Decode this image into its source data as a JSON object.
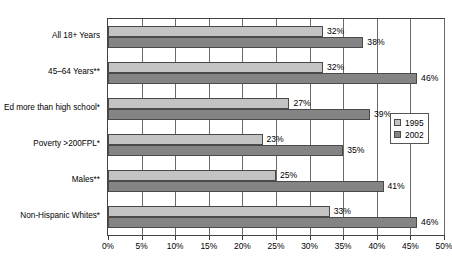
{
  "chart_data": {
    "type": "bar",
    "orientation": "horizontal",
    "title": "",
    "subtitle": "",
    "xlabel": "",
    "ylabel": "",
    "xlim": [
      0,
      50
    ],
    "grid": true,
    "grid_axis": "x",
    "legend_position": "right",
    "value_suffix": "%",
    "categories": [
      "All 18+ Years",
      "45–64 Years**",
      "Ed more than high school*",
      "Poverty >200FPL*",
      "Males**",
      "Non-Hispanic Whites*"
    ],
    "series": [
      {
        "name": "1995",
        "color": "#c3c3c3",
        "values": [
          32,
          32,
          27,
          23,
          25,
          33
        ],
        "labels": [
          "32%",
          "32%",
          "27%",
          "23%",
          "25%",
          "33%"
        ]
      },
      {
        "name": "2002",
        "color": "#848484",
        "values": [
          38,
          46,
          39,
          35,
          41,
          46
        ],
        "labels": [
          "38%",
          "46%",
          "39%",
          "35%",
          "41%",
          "46%"
        ]
      }
    ],
    "xticks": [
      0,
      5,
      10,
      15,
      20,
      25,
      30,
      35,
      40,
      45,
      50
    ],
    "xtick_labels": [
      "0%",
      "5%",
      "10%",
      "15%",
      "20%",
      "25%",
      "30%",
      "35%",
      "40%",
      "45%",
      "50%"
    ]
  },
  "legend": {
    "entries": [
      {
        "label": "1995",
        "color": "#c3c3c3"
      },
      {
        "label": "2002",
        "color": "#848484"
      }
    ]
  }
}
